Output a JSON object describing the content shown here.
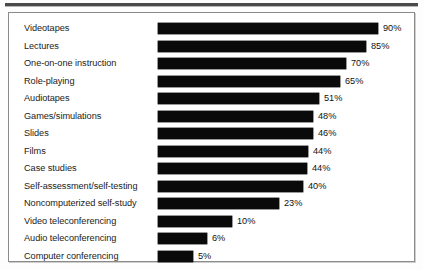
{
  "chart_data": {
    "type": "bar",
    "orientation": "horizontal",
    "title": "",
    "xlabel": "",
    "ylabel": "",
    "grid": false,
    "legend": null,
    "value_suffix": "%",
    "xlim": [
      0,
      100
    ],
    "categories": [
      "Videotapes",
      "Lectures",
      "One-on-one instruction",
      "Role-playing",
      "Audiotapes",
      "Games/simulations",
      "Slides",
      "Films",
      "Case studies",
      "Self-assessment/self-testing",
      "Noncomputerized self-study",
      "Video teleconferencing",
      "Audio teleconferencing",
      "Computer conferencing"
    ],
    "values": [
      90,
      85,
      70,
      65,
      51,
      48,
      46,
      44,
      44,
      40,
      23,
      10,
      6,
      5
    ],
    "value_labels": [
      "90%",
      "85%",
      "70%",
      "65%",
      "51%",
      "48%",
      "46%",
      "44%",
      "44%",
      "40%",
      "23%",
      "10%",
      "6%",
      "5%"
    ],
    "bar_pixel_widths": [
      220,
      208,
      188,
      182,
      161,
      155,
      155,
      150,
      149,
      145,
      121,
      74,
      49,
      35
    ],
    "bar_color": "#0a0a0a",
    "background_color": "#ffffff",
    "frame_color": "#8a8a8a"
  }
}
